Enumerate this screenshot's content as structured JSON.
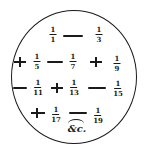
{
  "figure": {
    "terms": [
      {
        "sign": "",
        "numerator": "1",
        "denominator": "1"
      },
      {
        "sign": "minus",
        "numerator": "1",
        "denominator": "3"
      },
      {
        "sign": "plus",
        "numerator": "1",
        "denominator": "5"
      },
      {
        "sign": "minus",
        "numerator": "1",
        "denominator": "7"
      },
      {
        "sign": "plus",
        "numerator": "1",
        "denominator": "9"
      },
      {
        "sign": "minus",
        "numerator": "1",
        "denominator": "11"
      },
      {
        "sign": "plus",
        "numerator": "1",
        "denominator": "13"
      },
      {
        "sign": "minus",
        "numerator": "1",
        "denominator": "15"
      },
      {
        "sign": "plus",
        "numerator": "1",
        "denominator": "17"
      },
      {
        "sign": "minus",
        "numerator": "1",
        "denominator": "19"
      }
    ],
    "continuation": "&c.",
    "ink_color": "#1a1a1a",
    "background_color": "#ffffff"
  }
}
